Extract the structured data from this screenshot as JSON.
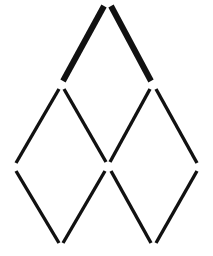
{
  "figure": {
    "background_color": "#ffffff",
    "stick_color": "#111111",
    "canvas": {
      "width": 213,
      "height": 256
    },
    "vertices": {
      "apex": {
        "name": "apex",
        "x": 107,
        "y": 5
      },
      "upper_left": {
        "name": "upper-left",
        "x": 61,
        "y": 85
      },
      "upper_right": {
        "name": "upper-right",
        "x": 153,
        "y": 85
      },
      "left": {
        "name": "left",
        "x": 14,
        "y": 167
      },
      "center": {
        "name": "center",
        "x": 108,
        "y": 166
      },
      "right": {
        "name": "right",
        "x": 199,
        "y": 167
      },
      "bottom_left": {
        "name": "bottom-left",
        "x": 61,
        "y": 246
      },
      "bottom_right": {
        "name": "bottom-right",
        "x": 153,
        "y": 246
      }
    },
    "sticks": [
      {
        "id": 1,
        "name": "stick-apex-to-upper-left",
        "x1": 104,
        "y1": 6,
        "x2": 63,
        "y2": 81,
        "width": 6,
        "color": "#111111"
      },
      {
        "id": 2,
        "name": "stick-apex-to-upper-right",
        "x1": 111,
        "y1": 6,
        "x2": 151,
        "y2": 81,
        "width": 6,
        "color": "#111111"
      },
      {
        "id": 3,
        "name": "stick-upper-left-to-left",
        "x1": 59,
        "y1": 89,
        "x2": 16,
        "y2": 163,
        "width": 3.4,
        "color": "#111111"
      },
      {
        "id": 4,
        "name": "stick-upper-left-to-center",
        "x1": 64,
        "y1": 89,
        "x2": 106,
        "y2": 162,
        "width": 3.4,
        "color": "#111111"
      },
      {
        "id": 5,
        "name": "stick-upper-right-to-center",
        "x1": 150,
        "y1": 89,
        "x2": 110,
        "y2": 162,
        "width": 3.4,
        "color": "#111111"
      },
      {
        "id": 6,
        "name": "stick-upper-right-to-right",
        "x1": 156,
        "y1": 89,
        "x2": 197,
        "y2": 163,
        "width": 3.4,
        "color": "#111111"
      },
      {
        "id": 7,
        "name": "stick-left-to-bottom-left",
        "x1": 16,
        "y1": 171,
        "x2": 59,
        "y2": 243,
        "width": 3.4,
        "color": "#111111"
      },
      {
        "id": 8,
        "name": "stick-center-to-bottom-left",
        "x1": 105,
        "y1": 171,
        "x2": 63,
        "y2": 243,
        "width": 3.4,
        "color": "#111111"
      },
      {
        "id": 9,
        "name": "stick-center-to-bottom-right",
        "x1": 111,
        "y1": 171,
        "x2": 151,
        "y2": 243,
        "width": 3.4,
        "color": "#111111"
      },
      {
        "id": 10,
        "name": "stick-right-to-bottom-right",
        "x1": 197,
        "y1": 171,
        "x2": 156,
        "y2": 243,
        "width": 3.4,
        "color": "#111111"
      }
    ]
  }
}
